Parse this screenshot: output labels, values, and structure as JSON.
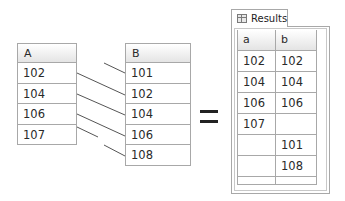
{
  "table_a": {
    "header": "A",
    "rows": [
      "102",
      "104",
      "106",
      "107"
    ]
  },
  "table_b": {
    "header": "B",
    "rows": [
      "101",
      "102",
      "104",
      "106",
      "108"
    ]
  },
  "operator": "=",
  "results": {
    "tab_label": "Results",
    "tab_icon": "grid-icon",
    "columns": [
      "a",
      "b"
    ],
    "rows": [
      [
        "102",
        "102"
      ],
      [
        "104",
        "104"
      ],
      [
        "106",
        "106"
      ],
      [
        "107",
        ""
      ],
      [
        "",
        "101"
      ],
      [
        "",
        "108"
      ]
    ]
  },
  "connectors": [
    {
      "from": "A.102",
      "to": "B.102"
    },
    {
      "from": "A.104",
      "to": "B.104"
    },
    {
      "from": "A.106",
      "to": "B.106"
    },
    {
      "from": "A.107",
      "to": null
    },
    {
      "from": null,
      "to": "B.101"
    },
    {
      "from": null,
      "to": "B.108"
    }
  ],
  "colors": {
    "border": "#a8a8a8",
    "line": "#555555",
    "header_gradient_top": "#ffffff",
    "header_gradient_bottom": "#e4e4e4"
  }
}
